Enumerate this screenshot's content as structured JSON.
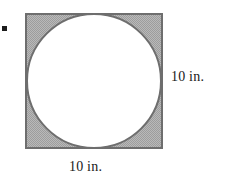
{
  "figure": {
    "kind": "inscribed-circle-in-square",
    "bullet_marker": "square-bullet",
    "square": {
      "side_label": "10 in.",
      "x": 25,
      "y": 13,
      "width": 138,
      "height": 136,
      "border_color": "#6e6e6e",
      "border_width": 2,
      "fill_color": "#aeaeae",
      "fill_pattern": "checker-dither"
    },
    "circle": {
      "cx": 94,
      "cy": 81,
      "r": 68,
      "stroke_color": "#6e6e6e",
      "stroke_width": 2,
      "fill_color": "#ffffff"
    },
    "labels": {
      "right": "10 in.",
      "bottom": "10 in."
    }
  }
}
